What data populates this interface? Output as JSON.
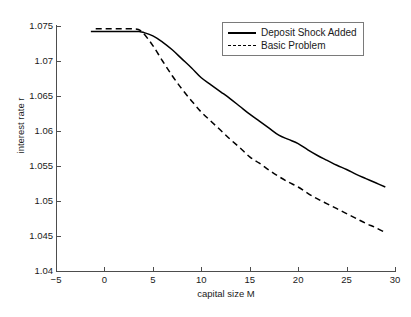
{
  "chart_data": {
    "type": "line",
    "title": "",
    "xlabel": "capital size M",
    "ylabel": "interest rate r",
    "xlim": [
      -5,
      30
    ],
    "ylim": [
      1.04,
      1.075
    ],
    "xticks": [
      -5,
      0,
      5,
      10,
      15,
      20,
      25,
      30
    ],
    "xtick_labels": [
      "−5",
      "0",
      "5",
      "10",
      "15",
      "20",
      "25",
      "30"
    ],
    "yticks": [
      1.04,
      1.045,
      1.05,
      1.055,
      1.06,
      1.065,
      1.07,
      1.075
    ],
    "ytick_labels": [
      "1.04",
      "1.045",
      "1.05",
      "1.055",
      "1.06",
      "1.065",
      "1.07",
      "1.075"
    ],
    "grid": false,
    "legend_position": "top-right",
    "series": [
      {
        "name": "Deposit Shock Added",
        "style": "solid",
        "color": "#000000",
        "x": [
          -1.4,
          0,
          1,
          2,
          3,
          3.6,
          4,
          5,
          6,
          7,
          8,
          9,
          10,
          11,
          12,
          13,
          14,
          15,
          16,
          17,
          18,
          19,
          20,
          21,
          22,
          23,
          24,
          25,
          26,
          27,
          28,
          29
        ],
        "y": [
          1.0742,
          1.0742,
          1.0742,
          1.0742,
          1.0742,
          1.0742,
          1.0741,
          1.0736,
          1.0727,
          1.0716,
          1.0703,
          1.069,
          1.0676,
          1.0666,
          1.0656,
          1.0646,
          1.0635,
          1.0624,
          1.0614,
          1.0604,
          1.0594,
          1.0588,
          1.0582,
          1.0573,
          1.0565,
          1.0558,
          1.0551,
          1.0545,
          1.0538,
          1.0532,
          1.0526,
          1.052
        ]
      },
      {
        "name": "Basic Problem",
        "style": "dashed",
        "color": "#000000",
        "x": [
          -0.9,
          0,
          1,
          2,
          3,
          3.5,
          4,
          5,
          6,
          7,
          8,
          9,
          10,
          11,
          12,
          13,
          14,
          15,
          16,
          17,
          18,
          19,
          20,
          21,
          22,
          23,
          24,
          25,
          26,
          27,
          28,
          29
        ],
        "y": [
          1.0746,
          1.0746,
          1.0746,
          1.0746,
          1.0746,
          1.0745,
          1.074,
          1.0722,
          1.07,
          1.0679,
          1.066,
          1.0643,
          1.0627,
          1.0614,
          1.0601,
          1.0588,
          1.0576,
          1.0563,
          1.0554,
          1.0544,
          1.0535,
          1.0527,
          1.052,
          1.0511,
          1.0503,
          1.0496,
          1.0489,
          1.0482,
          1.0475,
          1.0468,
          1.0462,
          1.0455
        ]
      }
    ]
  },
  "legend": {
    "items": [
      {
        "label": "Deposit Shock Added",
        "style": "solid"
      },
      {
        "label": "Basic Problem",
        "style": "dashed"
      }
    ]
  },
  "axes": {
    "x_title": "capital size M",
    "y_title": "interest rate r"
  },
  "top_caption": ""
}
